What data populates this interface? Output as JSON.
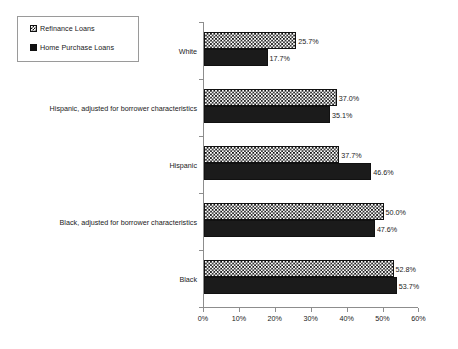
{
  "legend": {
    "position": "top-left",
    "entries": [
      {
        "label": "Refinance Loans",
        "marker": "checkered-square-icon"
      },
      {
        "label": "Home Purchase Loans",
        "marker": "solid-square-icon"
      }
    ]
  },
  "axis": {
    "x_ticks": [
      "0%",
      "10%",
      "20%",
      "30%",
      "40%",
      "50%",
      "60%"
    ]
  },
  "chart_data": {
    "type": "bar",
    "orientation": "horizontal",
    "title": "",
    "subtitle": "",
    "xlabel": "",
    "ylabel": "",
    "xlim": [
      0,
      60
    ],
    "xtick_step": 10,
    "grid": false,
    "legend_position": "top-left",
    "value_suffix": "%",
    "categories": [
      "White",
      "Hispanic, adjusted for borrower characteristics",
      "Hispanic",
      "Black, adjusted for borrower characteristics",
      "Black"
    ],
    "series": [
      {
        "name": "Refinance Loans",
        "values": [
          25.7,
          37.0,
          37.7,
          50.0,
          52.8
        ],
        "labels": [
          "25.7%",
          "37.0%",
          "37.7%",
          "50.0%",
          "52.8%"
        ]
      },
      {
        "name": "Home Purchase Loans",
        "values": [
          17.7,
          35.1,
          46.6,
          47.6,
          53.7
        ],
        "labels": [
          "17.7%",
          "35.1%",
          "46.6%",
          "47.6%",
          "53.7%"
        ]
      }
    ]
  },
  "colors": {
    "background": "#ffffff",
    "axis": "#8d8d8d",
    "bar_outline": "#111111",
    "home_purchase_fill": "#1b1b1b",
    "refinance_fill": "#ffffff",
    "text": "#1a1a1a"
  }
}
